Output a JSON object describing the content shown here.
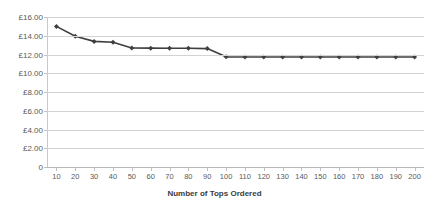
{
  "chart_data": {
    "type": "line",
    "title": "",
    "xlabel": "Number of Tops Ordered",
    "ylabel": "",
    "categories": [
      10,
      20,
      30,
      40,
      50,
      60,
      70,
      80,
      90,
      100,
      110,
      120,
      130,
      140,
      150,
      160,
      170,
      180,
      190,
      200
    ],
    "values": [
      15.0,
      13.95,
      13.4,
      13.3,
      12.7,
      12.68,
      12.67,
      12.67,
      12.63,
      11.75,
      11.73,
      11.73,
      11.73,
      11.73,
      11.73,
      11.73,
      11.73,
      11.73,
      11.73,
      11.73
    ],
    "ylim": [
      0,
      16
    ],
    "y_tick_labels": [
      "£16.00",
      "£14.00",
      "£12.00",
      "£10.00",
      "£8.00",
      "£6.00",
      "£4.00",
      "£2.00",
      "0"
    ],
    "y_tick_values": [
      16,
      14,
      12,
      10,
      8,
      6,
      4,
      2,
      0
    ],
    "x_tick_labels": [
      "10",
      "20",
      "30",
      "40",
      "50",
      "60",
      "70",
      "80",
      "90",
      "100",
      "110",
      "120",
      "130",
      "140",
      "150",
      "160",
      "170",
      "180",
      "190",
      "200"
    ],
    "grid": "horizontal",
    "legend": "none",
    "marker": "diamond",
    "series_color": "#3f3f3f",
    "gridline_color": "#d3d3d3",
    "background_color": "#ffffff"
  }
}
